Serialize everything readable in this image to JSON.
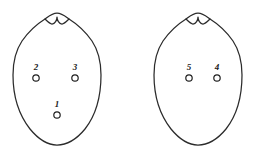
{
  "figure": {
    "background_color": "#ffffff",
    "stroke_color": "#2b2b2b",
    "label_color": "#1a1a1a",
    "shapes": [
      {
        "name": "left-outline",
        "path": "M 57 13 C 52 13 49 16 45 19 C 37 24 29 31 22 41 C 16 50 13 61 13 75 C 13 96 19 115 30 129 C 39 140 48 145 57 145 C 66 145 76 140 85 129 C 96 115 101 96 101 75 C 101 61 98 50 92 41 C 85 31 77 24 69 19 C 65 16 62 13 57 13 Z"
      },
      {
        "name": "left-notch",
        "path": "M 45 19 C 48 22 50 24 52 24 C 55 24 57 20 57 17 C 57 20 59 24 62 24 C 64 24 66 22 69 19"
      },
      {
        "name": "right-outline",
        "path": "M 198 13 C 193 13 190 16 186 19 C 178 24 170 31 163 41 C 157 50 154 61 154 75 C 154 96 160 115 171 129 C 180 140 189 145 198 145 C 207 145 217 140 226 129 C 237 115 242 96 242 75 C 242 61 239 50 233 41 C 226 31 218 24 210 19 C 206 16 203 13 198 13 Z"
      },
      {
        "name": "right-notch",
        "path": "M 186 19 C 189 22 191 24 193 24 C 196 24 198 20 198 17 C 198 20 200 24 203 24 C 205 24 207 22 210 19"
      }
    ],
    "markers": [
      {
        "id": "marker-1",
        "label": "1",
        "cx": 57,
        "cy": 115,
        "r": 3.2,
        "label_x": 57,
        "label_y": 107
      },
      {
        "id": "marker-2",
        "label": "2",
        "cx": 36,
        "cy": 78,
        "r": 3.2,
        "label_x": 36,
        "label_y": 70
      },
      {
        "id": "marker-3",
        "label": "3",
        "cx": 75,
        "cy": 78,
        "r": 3.2,
        "label_x": 75,
        "label_y": 70
      },
      {
        "id": "marker-4",
        "label": "4",
        "cx": 217,
        "cy": 78,
        "r": 3.2,
        "label_x": 217,
        "label_y": 70
      },
      {
        "id": "marker-5",
        "label": "5",
        "cx": 189,
        "cy": 78,
        "r": 3.2,
        "label_x": 189,
        "label_y": 70
      }
    ]
  }
}
